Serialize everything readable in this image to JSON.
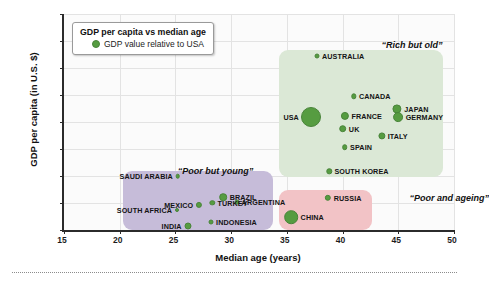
{
  "chart_data": {
    "type": "scatter",
    "title": "GDP per capita vs median age",
    "xlabel": "Median age (years)",
    "ylabel": "GDP per capita (in U.S. $)",
    "xlim": [
      15,
      50
    ],
    "ylim": [
      0,
      80000
    ],
    "xticks": [
      15,
      20,
      25,
      30,
      35,
      40,
      45,
      50
    ],
    "yticks": [
      0,
      10000,
      20000,
      30000,
      40000,
      50000,
      60000,
      70000,
      80000
    ],
    "grid": true,
    "legend_position": "upper-left-inside",
    "bubble_meaning": "GDP value relative to USA",
    "series": [
      {
        "name": "Countries",
        "points": [
          {
            "label": "AUSTRALIA",
            "x": 37.7,
            "y": 64500,
            "size": 5.0,
            "label_side": "right",
            "group": "Rich but old"
          },
          {
            "label": "CANADA",
            "x": 41.0,
            "y": 49500,
            "size": 5.4,
            "label_side": "right",
            "group": "Rich but old"
          },
          {
            "label": "JAPAN",
            "x": 44.9,
            "y": 44800,
            "size": 9.2,
            "label_side": "right",
            "group": "Rich but old"
          },
          {
            "label": "USA",
            "x": 37.2,
            "y": 42000,
            "size": 20.0,
            "label_side": "left",
            "group": "Rich but old"
          },
          {
            "label": "FRANCE",
            "x": 40.2,
            "y": 42300,
            "size": 8.2,
            "label_side": "right",
            "group": "Rich but old"
          },
          {
            "label": "GERMANY",
            "x": 45.0,
            "y": 41800,
            "size": 9.8,
            "label_side": "right",
            "group": "Rich but old"
          },
          {
            "label": "UK",
            "x": 40.0,
            "y": 37500,
            "size": 7.6,
            "label_side": "right",
            "group": "Rich but old"
          },
          {
            "label": "ITALY",
            "x": 43.5,
            "y": 34800,
            "size": 7.2,
            "label_side": "right",
            "group": "Rich but old"
          },
          {
            "label": "SPAIN",
            "x": 40.2,
            "y": 30600,
            "size": 5.6,
            "label_side": "right",
            "group": "Rich but old"
          },
          {
            "label": "SOUTH KOREA",
            "x": 38.8,
            "y": 21800,
            "size": 5.4,
            "label_side": "right",
            "group": "Rich but old"
          },
          {
            "label": "RUSSIA",
            "x": 38.7,
            "y": 12000,
            "size": 6.4,
            "label_side": "right",
            "group": "Poor and ageing"
          },
          {
            "label": "CHINA",
            "x": 35.4,
            "y": 4700,
            "size": 13.6,
            "label_side": "right",
            "group": "Poor and ageing"
          },
          {
            "label": "SAUDI ARABIA",
            "x": 25.2,
            "y": 20000,
            "size": 4.6,
            "label_side": "left",
            "group": "Poor but young"
          },
          {
            "label": "BRAZIL",
            "x": 29.3,
            "y": 12200,
            "size": 7.6,
            "label_side": "right",
            "group": "Poor but young"
          },
          {
            "label": "ARGENTINA",
            "x": 30.5,
            "y": 10400,
            "size": 4.8,
            "label_side": "right",
            "group": "Poor but young"
          },
          {
            "label": "MEXICO",
            "x": 27.1,
            "y": 9400,
            "size": 6.2,
            "label_side": "left",
            "group": "Poor but young"
          },
          {
            "label": "TURKEY",
            "x": 28.3,
            "y": 10000,
            "size": 5.4,
            "label_side": "right",
            "group": "Poor but young"
          },
          {
            "label": "SOUTH AFRICA",
            "x": 25.1,
            "y": 7400,
            "size": 4.0,
            "label_side": "left",
            "group": "Poor but young"
          },
          {
            "label": "INDONESIA",
            "x": 28.2,
            "y": 3100,
            "size": 5.0,
            "label_side": "right",
            "group": "Poor but young"
          },
          {
            "label": "INDIA",
            "x": 26.1,
            "y": 1500,
            "size": 7.0,
            "label_side": "left",
            "group": "Poor but young"
          }
        ]
      }
    ],
    "regions": [
      {
        "name": "Rich but old",
        "label": "“Rich but old”",
        "color": "#dbe8d6",
        "x0": 34.3,
        "x1": 49.0,
        "y0": 19800,
        "y1": 66500,
        "label_x": 43.5,
        "label_y": 70500
      },
      {
        "name": "Poor but young",
        "label": "“Poor but young”",
        "color": "#c6bcd9",
        "x0": 20.3,
        "x1": 33.8,
        "y0": 150,
        "y1": 21800,
        "label_x": 25.2,
        "label_y": 23800
      },
      {
        "name": "Poor and ageing",
        "label": "“Poor and ageing”",
        "color": "#f2c3c6",
        "x0": 34.3,
        "x1": 42.6,
        "y0": 150,
        "y1": 15000,
        "label_x": 46.0,
        "label_y": 13600
      }
    ],
    "colors": {
      "bubble": "#569c41",
      "bubble_edge": "#49843a",
      "rich_but_old": "#dbe8d6",
      "poor_but_young": "#c6bcd9",
      "poor_and_ageing": "#f2c3c6",
      "axis": "#2b2b2b",
      "grid": "#e3e3e3",
      "plot_background": "#fbfbfb"
    }
  }
}
